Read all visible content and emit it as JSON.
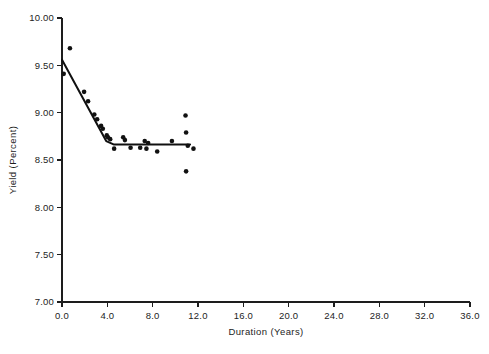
{
  "chart_data": {
    "type": "scatter",
    "title": "",
    "xlabel": "Duration (Years)",
    "ylabel": "Yield (Percent)",
    "xlim": [
      0.0,
      36.0
    ],
    "ylim": [
      7.0,
      10.0
    ],
    "xticks": [
      "0.0",
      "4.0",
      "8.0",
      "12.0",
      "16.0",
      "20.0",
      "24.0",
      "28.0",
      "32.0",
      "36.0"
    ],
    "xtick_values": [
      0,
      4,
      8,
      12,
      16,
      20,
      24,
      28,
      32,
      36
    ],
    "yticks": [
      "7.00",
      "7.50",
      "8.00",
      "8.50",
      "9.00",
      "9.50",
      "10.00"
    ],
    "ytick_values": [
      7.0,
      7.5,
      8.0,
      8.5,
      9.0,
      9.5,
      10.0
    ],
    "grid": false,
    "legend": "none",
    "marker": "filled-circle",
    "marker_color": "#111111",
    "line_color": "#101010",
    "series": [
      {
        "name": "Observed yield",
        "points": [
          [
            0.15,
            9.41
          ],
          [
            0.7,
            9.68
          ],
          [
            1.95,
            9.22
          ],
          [
            2.3,
            9.12
          ],
          [
            2.85,
            8.98
          ],
          [
            3.1,
            8.93
          ],
          [
            3.45,
            8.86
          ],
          [
            3.6,
            8.83
          ],
          [
            3.95,
            8.76
          ],
          [
            4.05,
            8.74
          ],
          [
            4.25,
            8.72
          ],
          [
            4.6,
            8.62
          ],
          [
            5.4,
            8.74
          ],
          [
            5.55,
            8.71
          ],
          [
            6.05,
            8.63
          ],
          [
            6.9,
            8.63
          ],
          [
            7.3,
            8.7
          ],
          [
            7.45,
            8.62
          ],
          [
            7.6,
            8.68
          ],
          [
            8.4,
            8.59
          ],
          [
            9.7,
            8.7
          ],
          [
            10.9,
            8.97
          ],
          [
            10.95,
            8.79
          ],
          [
            10.95,
            8.38
          ],
          [
            11.1,
            8.65
          ],
          [
            11.6,
            8.62
          ]
        ]
      }
    ],
    "fit_line": {
      "name": "Segmented (broken-stick) regression fit",
      "points": [
        [
          0.0,
          9.56
        ],
        [
          3.9,
          8.7
        ],
        [
          4.55,
          8.665
        ],
        [
          11.3,
          8.665
        ]
      ]
    }
  }
}
